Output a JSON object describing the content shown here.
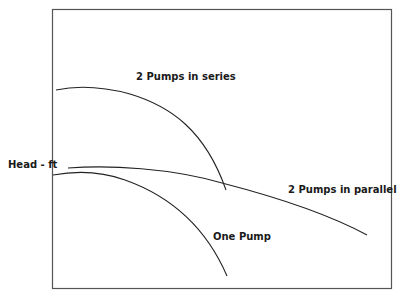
{
  "diagram": {
    "type": "pump-performance-curves",
    "axis_label_y": "Head - ft",
    "colors": {
      "frame": "#555555",
      "curve": "#222222",
      "text": "#1a1a1a",
      "background": "#ffffff"
    },
    "curves": [
      {
        "name": "2 Pumps in series",
        "label": "2 Pumps in series"
      },
      {
        "name": "2 Pumps in parallel",
        "label": "2 Pumps in parallel"
      },
      {
        "name": "One Pump",
        "label": "One Pump"
      }
    ]
  }
}
